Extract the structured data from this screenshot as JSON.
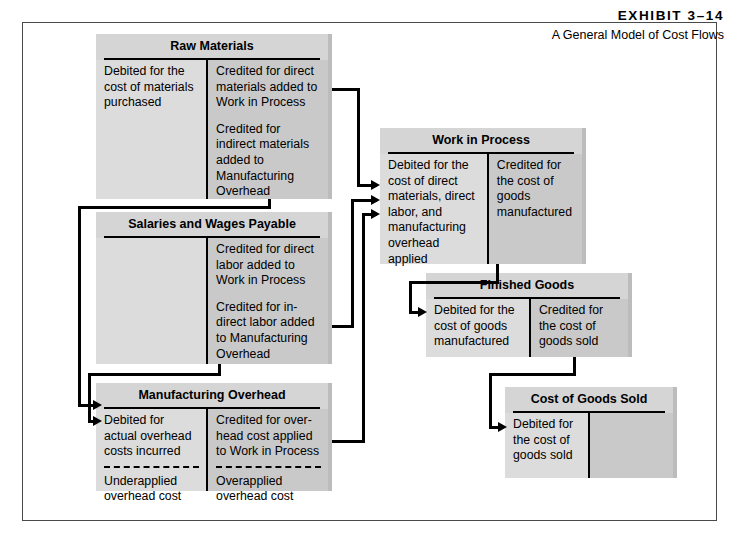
{
  "exhibit": {
    "label": "EXHIBIT 3–14",
    "subtitle": "A General Model of Cost Flows"
  },
  "accounts": {
    "raw_materials": {
      "title": "Raw Materials",
      "debit": [
        "Debited for the cost of materials purchased"
      ],
      "credit": [
        "Credited for direct materials added to Work in Process",
        "Credited for indirect materials added to Manufacturing Overhead"
      ]
    },
    "salaries_wages_payable": {
      "title": "Salaries and Wages Payable",
      "debit": [],
      "credit": [
        "Credited for direct labor added to Work in Process",
        "Credited for in-direct labor added to Manufacturing Overhead"
      ]
    },
    "manufacturing_overhead": {
      "title": "Manufacturing Overhead",
      "debit": [
        "Debited for actual overhead costs incurred"
      ],
      "credit": [
        "Credited for over-head cost applied to Work in Process"
      ],
      "debit_lower": [
        "Underapplied overhead cost"
      ],
      "credit_lower": [
        "Overapplied overhead cost"
      ]
    },
    "work_in_process": {
      "title": "Work in Process",
      "debit": [
        "Debited for the cost of direct materials, direct labor, and manufacturing overhead applied"
      ],
      "credit": [
        "Credited for the cost of goods manufactured"
      ]
    },
    "finished_goods": {
      "title": "Finished Goods",
      "debit": [
        "Debited for the cost of goods manufactured"
      ],
      "credit": [
        "Credited for the cost of goods sold"
      ]
    },
    "cost_of_goods_sold": {
      "title": "Cost of Goods Sold",
      "debit": [
        "Debited for the cost of goods sold"
      ],
      "credit": []
    }
  }
}
